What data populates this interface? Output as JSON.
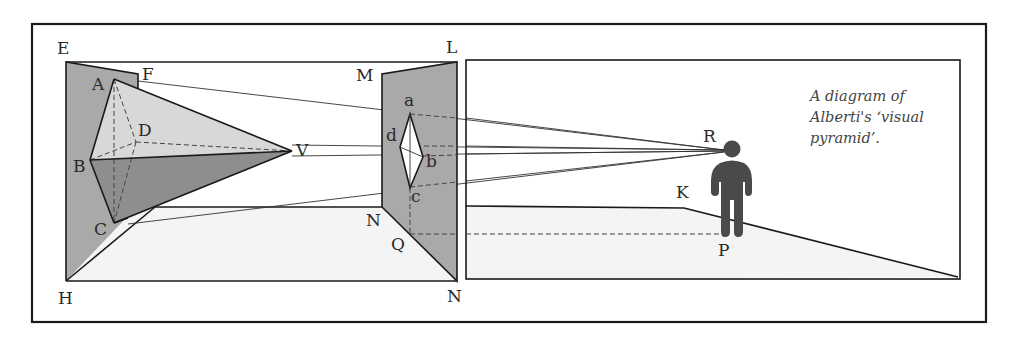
{
  "caption": {
    "lines": [
      "A diagram of",
      "Alberti's ‘visual",
      "pyramid’."
    ]
  },
  "colors": {
    "panel_gray": "#a9a9a9",
    "pyramid_light": "#d8d8d8",
    "pyramid_dark": "#8e8e8e",
    "floor": "#f4f4f4",
    "figure": "#4a4a4a",
    "stroke": "#1a1a1a"
  },
  "labels": {
    "E": "E",
    "F": "F",
    "A": "A",
    "D": "D",
    "B": "B",
    "C": "C",
    "H": "H",
    "V": "V",
    "M": "M",
    "L": "L",
    "a": "a",
    "b": "b",
    "c": "c",
    "d": "d",
    "N_upper": "N",
    "N_lower": "N",
    "Q": "Q",
    "R": "R",
    "K": "K",
    "P": "P"
  },
  "figure": {
    "object_panel": "EFH",
    "pyramid_vertices": [
      "A",
      "B",
      "C",
      "D",
      "V"
    ],
    "picture_plane": "MLN",
    "section_vertices": [
      "a",
      "b",
      "c",
      "d"
    ],
    "eye_point": "R",
    "ground_point": "P"
  }
}
